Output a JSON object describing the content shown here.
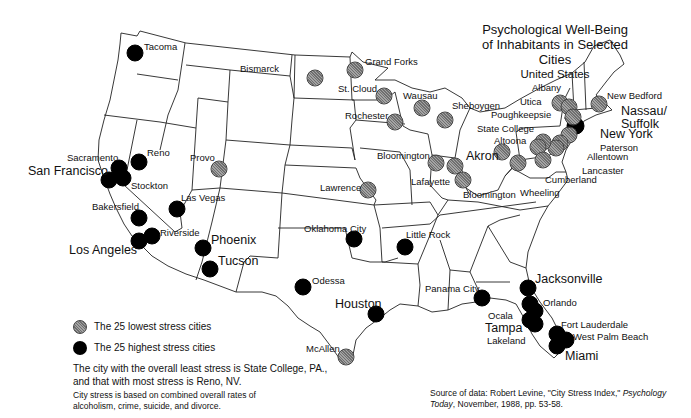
{
  "title": {
    "line1": "Psychological  Well-Being",
    "line2": "of Inhabitants in Selected Cities",
    "line3": "United States"
  },
  "colors": {
    "low_stress": "#8a8a8a",
    "high_stress": "#000000",
    "outline": "#222222"
  },
  "legend": {
    "low_label": "The 25 lowest stress cities",
    "high_label": "The 25 highest stress cities"
  },
  "notes": {
    "summary_line1": "The city with the overall least stress is State College, PA.,",
    "summary_line2": "and that with most stress is Reno, NV.",
    "basis_line1": "City stress is based on combined overall rates of",
    "basis_line2": "alcoholism, crime, suicide, and divorce."
  },
  "source": {
    "prefix": "Source of data: Robert Levine, \"City Stress Index,\" ",
    "journal": "Psychology Today",
    "suffix": ", November, 1988, pp. 53-58."
  },
  "cities": [
    {
      "name": "Tacoma",
      "stress": "high",
      "x": 135,
      "y": 53,
      "lx": 144,
      "ly": 42,
      "big": false
    },
    {
      "name": "Sacramento",
      "stress": "high",
      "x": 119,
      "y": 168,
      "lx": 67,
      "ly": 153,
      "big": false
    },
    {
      "name": "San Francisco",
      "stress": "high",
      "x": 109,
      "y": 180,
      "lx": 28,
      "ly": 165,
      "big": true
    },
    {
      "name": "Stockton",
      "stress": "high",
      "x": 123,
      "y": 178,
      "lx": 131,
      "ly": 181,
      "big": false
    },
    {
      "name": "Reno",
      "stress": "high",
      "x": 139,
      "y": 162,
      "lx": 147,
      "ly": 148,
      "big": false
    },
    {
      "name": "Bakersfield",
      "stress": "high",
      "x": 139,
      "y": 218,
      "lx": 92,
      "ly": 202,
      "big": false
    },
    {
      "name": "Riverside",
      "stress": "high",
      "x": 152,
      "y": 236,
      "lx": 160,
      "ly": 228,
      "big": false
    },
    {
      "name": "Los Angeles",
      "stress": "high",
      "x": 139,
      "y": 241,
      "lx": 69,
      "ly": 244,
      "big": true
    },
    {
      "name": "Las Vegas",
      "stress": "high",
      "x": 177,
      "y": 209,
      "lx": 181,
      "ly": 193,
      "big": false
    },
    {
      "name": "Phoenix",
      "stress": "high",
      "x": 203,
      "y": 248,
      "lx": 211,
      "ly": 234,
      "big": true
    },
    {
      "name": "Tucson",
      "stress": "high",
      "x": 210,
      "y": 269,
      "lx": 218,
      "ly": 255,
      "big": true
    },
    {
      "name": "Odessa",
      "stress": "high",
      "x": 303,
      "y": 287,
      "lx": 312,
      "ly": 276,
      "big": false
    },
    {
      "name": "Oklahoma City",
      "stress": "high",
      "x": 354,
      "y": 239,
      "lx": 304,
      "ly": 224,
      "big": false
    },
    {
      "name": "Little Rock",
      "stress": "high",
      "x": 405,
      "y": 247,
      "lx": 406,
      "ly": 230,
      "big": false
    },
    {
      "name": "Houston",
      "stress": "high",
      "x": 376,
      "y": 314,
      "lx": 335,
      "ly": 298,
      "big": true
    },
    {
      "name": "Panama City",
      "stress": "high",
      "x": 482,
      "y": 298,
      "lx": 425,
      "ly": 284,
      "big": false
    },
    {
      "name": "Jacksonville",
      "stress": "high",
      "x": 528,
      "y": 288,
      "lx": 535,
      "ly": 273,
      "big": true
    },
    {
      "name": "Orlando",
      "stress": "high",
      "x": 530,
      "y": 304,
      "lx": 543,
      "ly": 298,
      "big": false
    },
    {
      "name": "Ocala",
      "stress": "high",
      "x": 535,
      "y": 311,
      "lx": 488,
      "ly": 311,
      "big": false
    },
    {
      "name": "Tampa",
      "stress": "high",
      "x": 530,
      "y": 320,
      "lx": 485,
      "ly": 322,
      "big": true
    },
    {
      "name": "Lakeland",
      "stress": "high",
      "x": 535,
      "y": 324,
      "lx": 487,
      "ly": 336,
      "big": false
    },
    {
      "name": "Fort Lauderdale",
      "stress": "high",
      "x": 557,
      "y": 334,
      "lx": 561,
      "ly": 320,
      "big": false
    },
    {
      "name": "West Palm Beach",
      "stress": "high",
      "x": 566,
      "y": 340,
      "lx": 573,
      "ly": 332,
      "big": false
    },
    {
      "name": "Miami",
      "stress": "high",
      "x": 557,
      "y": 346,
      "lx": 565,
      "ly": 350,
      "big": true
    },
    {
      "name": "New York",
      "stress": "high",
      "x": 575,
      "y": 126,
      "lx": 600,
      "ly": 128,
      "big": true
    },
    {
      "name": "Nassau/ Suffolk",
      "stress": "high",
      "x": 576,
      "y": 126,
      "lx": 621,
      "ly": 105,
      "big": true
    },
    {
      "name": "Paterson",
      "stress": "low",
      "x": 569,
      "y": 135,
      "lx": 600,
      "ly": 143,
      "big": false
    },
    {
      "name": "Allentown",
      "stress": "low",
      "x": 560,
      "y": 143,
      "lx": 587,
      "ly": 152,
      "big": false
    },
    {
      "name": "Lancaster",
      "stress": "low",
      "x": 556,
      "y": 148,
      "lx": 582,
      "ly": 166,
      "big": false
    },
    {
      "name": "Bismarck",
      "stress": "low",
      "x": 315,
      "y": 78,
      "lx": 240,
      "ly": 64,
      "big": false
    },
    {
      "name": "Grand Forks",
      "stress": "low",
      "x": 355,
      "y": 70,
      "lx": 365,
      "ly": 57,
      "big": false
    },
    {
      "name": "St. Cloud",
      "stress": "low",
      "x": 384,
      "y": 96,
      "lx": 338,
      "ly": 84,
      "big": false
    },
    {
      "name": "Rochester",
      "stress": "low",
      "x": 395,
      "y": 122,
      "lx": 345,
      "ly": 111,
      "big": false
    },
    {
      "name": "Wausau",
      "stress": "low",
      "x": 422,
      "y": 108,
      "lx": 403,
      "ly": 91,
      "big": false
    },
    {
      "name": "Sheboygen",
      "stress": "low",
      "x": 445,
      "y": 120,
      "lx": 452,
      "ly": 101,
      "big": false
    },
    {
      "name": "Albany",
      "stress": "low",
      "x": 560,
      "y": 103,
      "lx": 532,
      "ly": 83,
      "big": false
    },
    {
      "name": "Utica",
      "stress": "low",
      "x": 569,
      "y": 107,
      "lx": 520,
      "ly": 97,
      "big": false
    },
    {
      "name": "Poughkeepsie",
      "stress": "low",
      "x": 573,
      "y": 117,
      "lx": 491,
      "ly": 110,
      "big": false
    },
    {
      "name": "New Bedford",
      "stress": "low",
      "x": 599,
      "y": 104,
      "lx": 607,
      "ly": 91,
      "big": false
    },
    {
      "name": "State College",
      "stress": "low",
      "x": 543,
      "y": 142,
      "lx": 477,
      "ly": 124,
      "big": false
    },
    {
      "name": "Altoona",
      "stress": "low",
      "x": 538,
      "y": 147,
      "lx": 494,
      "ly": 136,
      "big": false
    },
    {
      "name": "Cumberland",
      "stress": "low",
      "x": 543,
      "y": 160,
      "lx": 545,
      "ly": 175,
      "big": false
    },
    {
      "name": "Wheeling",
      "stress": "low",
      "x": 518,
      "y": 163,
      "lx": 520,
      "ly": 188,
      "big": false
    },
    {
      "name": "Akron",
      "stress": "low",
      "x": 502,
      "y": 152,
      "lx": 466,
      "ly": 150,
      "big": true
    },
    {
      "name": "Bloomington",
      "stress": "low",
      "x": 436,
      "y": 163,
      "lx": 377,
      "ly": 151,
      "big": false
    },
    {
      "name": "Lafayette",
      "stress": "low",
      "x": 455,
      "y": 166,
      "lx": 411,
      "ly": 177,
      "big": false
    },
    {
      "name": "Bloomington ",
      "stress": "low",
      "x": 463,
      "y": 180,
      "lx": 463,
      "ly": 190,
      "big": false
    },
    {
      "name": "Provo",
      "stress": "low",
      "x": 219,
      "y": 169,
      "lx": 190,
      "ly": 153,
      "big": false
    },
    {
      "name": "Lawrence",
      "stress": "low",
      "x": 368,
      "y": 190,
      "lx": 320,
      "ly": 183,
      "big": false
    },
    {
      "name": "McAllen",
      "stress": "low",
      "x": 346,
      "y": 357,
      "lx": 306,
      "ly": 344,
      "big": false
    }
  ]
}
